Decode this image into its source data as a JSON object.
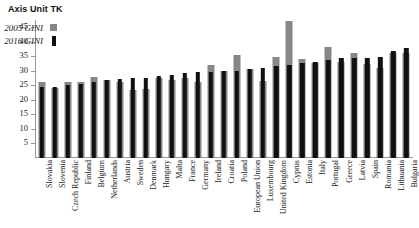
{
  "title": "Axis Unit TK",
  "legend": {
    "position": "top-left-inside",
    "entries": [
      {
        "label": "2005 GINI",
        "color": "#878787",
        "swatch": "square-gray"
      },
      {
        "label": "2016 GINI",
        "color": "#111111",
        "swatch": "bar-black"
      }
    ]
  },
  "axis": {
    "y_ticks": [
      5,
      10,
      15,
      20,
      25,
      30,
      35,
      40,
      45
    ],
    "y_min": 0,
    "y_max": 47.5
  },
  "chart_data": {
    "type": "bar",
    "title": "Axis Unit TK",
    "xlabel": "",
    "ylabel": "Axis Unit TK",
    "ylim": [
      0,
      47.5
    ],
    "grid": false,
    "legend_position": "top-left-inside",
    "categories": [
      "Slovakia",
      "Slovenia",
      "Czech Republic",
      "Finland",
      "Belgium",
      "Netherlands",
      "Austria",
      "Sweden",
      "Denmark",
      "Hungary",
      "Malta",
      "France",
      "Germany",
      "Ireland",
      "Croatia",
      "Poland",
      "European Union",
      "Luxembourg",
      "United Kingdom",
      "Cyprus",
      "Estonia",
      "Italy",
      "Portugal",
      "Greece",
      "Latvia",
      "Spain",
      "Romania",
      "Lithuania",
      "Bulgaria"
    ],
    "series": [
      {
        "name": "2005 GINI",
        "color": "#878787",
        "values": [
          26.2,
          24.0,
          26.0,
          26.0,
          28.0,
          26.9,
          26.3,
          23.4,
          23.9,
          27.6,
          27.0,
          27.7,
          26.1,
          31.9,
          30.0,
          35.6,
          30.6,
          26.5,
          34.6,
          47.3,
          34.1,
          32.8,
          38.1,
          33.2,
          36.2,
          32.2,
          31.0,
          36.3,
          36.0
        ]
      },
      {
        "name": "2016 GINI",
        "color": "#111111",
        "values": [
          24.3,
          24.4,
          25.1,
          25.4,
          26.3,
          26.9,
          27.2,
          27.6,
          27.7,
          28.2,
          28.5,
          29.3,
          29.5,
          29.5,
          29.8,
          29.8,
          30.8,
          31.0,
          31.5,
          32.1,
          32.7,
          33.1,
          33.9,
          34.3,
          34.5,
          34.5,
          34.7,
          37.0,
          37.7
        ]
      }
    ]
  }
}
